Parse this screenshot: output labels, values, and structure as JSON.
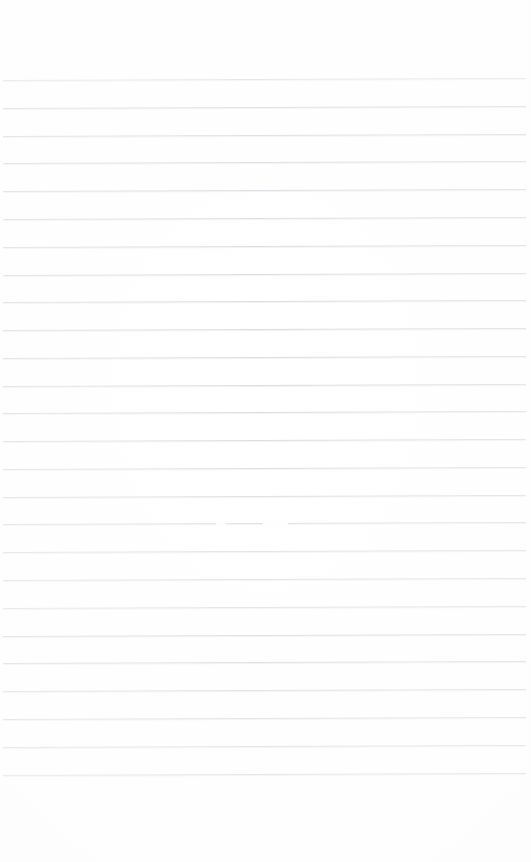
{
  "page": {
    "kind": "scanned-blank-lined-paper",
    "width": 531,
    "height": 862,
    "background_color": "#ffffff",
    "written_content": "",
    "header_text": "",
    "footer_text": "",
    "page_number": ""
  },
  "ruling": {
    "line_color": "#d6d9de",
    "line_thickness_px": 1,
    "line_count": 26,
    "first_line_y": 80,
    "line_spacing_px": 27.8,
    "left_margin_x": 3,
    "right_edge_x": 526,
    "slant_degrees": -0.22,
    "margin_rule_present": false,
    "top_blank_height_px": 80,
    "bottom_blank_height_px": 86,
    "line_y_positions": [
      80,
      108,
      136,
      163,
      191,
      219,
      247,
      275,
      302,
      330,
      358,
      386,
      413,
      441,
      469,
      497,
      524,
      552,
      580,
      608,
      636,
      663,
      691,
      719,
      747,
      775
    ]
  },
  "artifacts": {
    "scan_dropouts": [
      {
        "x": 262,
        "y": 523,
        "width": 26
      },
      {
        "x": 216,
        "y": 523,
        "width": 10
      }
    ]
  }
}
